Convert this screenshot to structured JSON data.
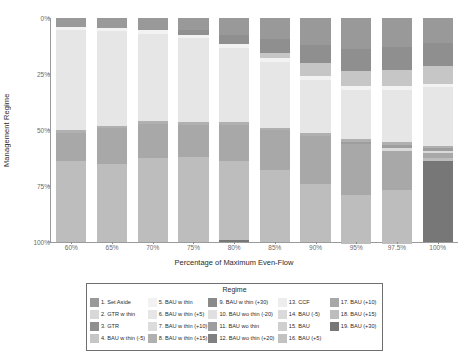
{
  "chart_data": {
    "type": "bar",
    "title": "",
    "xlabel": "Percentage of Maximum Even-Flow",
    "ylabel": "Management Regime",
    "stacked": true,
    "normalized_percent": true,
    "y_inverted": true,
    "ylim": [
      0,
      100
    ],
    "yticks": [
      "0%",
      "25%",
      "50%",
      "75%",
      "100%"
    ],
    "ytick_values": [
      0,
      25,
      50,
      75,
      100
    ],
    "grid": false,
    "legend_position": "bottom",
    "legend_title": "Regime",
    "categories": [
      "60%",
      "65%",
      "70%",
      "75%",
      "80%",
      "85%",
      "90%",
      "95%",
      "97.5%",
      "100%"
    ],
    "series": [
      {
        "name": "1. Set Aside",
        "color": "#999999",
        "values": [
          4.0,
          4.5,
          5.5,
          5.5,
          7.5,
          9.5,
          12.0,
          14.0,
          13.0,
          11.0
        ]
      },
      {
        "name": "2. GTR w thin",
        "color": "#d8d8d8",
        "values": [
          0.0,
          0.0,
          0.0,
          0.0,
          0.0,
          0.0,
          0.0,
          0.0,
          0.0,
          0.0
        ]
      },
      {
        "name": "3. GTR",
        "color": "#8f8f8f",
        "values": [
          0.0,
          0.0,
          0.0,
          2.0,
          4.0,
          6.0,
          8.0,
          9.5,
          10.0,
          10.5
        ]
      },
      {
        "name": "4. BAU w thin (-5)",
        "color": "#c6c6c6",
        "values": [
          0.0,
          0.0,
          0.0,
          0.0,
          0.0,
          2.5,
          6.0,
          7.0,
          7.5,
          8.0
        ]
      },
      {
        "name": "5. BAU w thin",
        "color": "#f2f2f2",
        "values": [
          1.5,
          1.5,
          1.5,
          1.5,
          2.0,
          1.5,
          1.5,
          1.5,
          1.5,
          1.5
        ]
      },
      {
        "name": "6. BAU w thin (+5)",
        "color": "#e6e6e6",
        "values": [
          44.5,
          42.0,
          39.0,
          37.5,
          33.0,
          29.5,
          24.0,
          22.0,
          23.5,
          26.0
        ]
      },
      {
        "name": "7. BAU w thin (+10)",
        "color": "#dcdcdc",
        "values": [
          0.0,
          0.0,
          0.0,
          0.0,
          0.0,
          0.0,
          0.0,
          0.0,
          0.0,
          0.0
        ]
      },
      {
        "name": "8. BAU w thin (+15)",
        "color": "#b0b0b0",
        "values": [
          1.2,
          1.2,
          1.2,
          1.2,
          1.2,
          1.2,
          1.2,
          1.2,
          1.2,
          1.2
        ]
      },
      {
        "name": "9. BAU w thin (+30)",
        "color": "#8a8a8a",
        "values": [
          0.0,
          0.0,
          0.0,
          0.0,
          0.0,
          0.0,
          0.0,
          0.0,
          0.0,
          0.0
        ]
      },
      {
        "name": "10. BAU wo thin (-20)",
        "color": "#e0e0e0",
        "values": [
          0.0,
          0.0,
          0.0,
          0.0,
          0.0,
          0.0,
          0.0,
          0.0,
          0.0,
          0.0
        ]
      },
      {
        "name": "11. BAU wo thin",
        "color": "#9e9e9e",
        "values": [
          0.0,
          0.0,
          0.0,
          0.0,
          0.0,
          0.0,
          0.0,
          1.2,
          1.2,
          1.0
        ]
      },
      {
        "name": "12. BAU wo thin (+20)",
        "color": "#808080",
        "values": [
          0.0,
          0.0,
          0.0,
          0.0,
          0.0,
          0.0,
          0.0,
          0.0,
          0.0,
          0.0
        ]
      },
      {
        "name": "13. CCF",
        "color": "#ededed",
        "values": [
          0.0,
          0.0,
          0.0,
          0.0,
          0.0,
          0.0,
          0.0,
          0.0,
          0.0,
          0.0
        ]
      },
      {
        "name": "14. BAU (-5)",
        "color": "#dadada",
        "values": [
          0.0,
          0.0,
          0.0,
          0.0,
          0.0,
          0.0,
          0.0,
          0.0,
          1.5,
          1.0
        ]
      },
      {
        "name": "15. BAU",
        "color": "#cfcfcf",
        "values": [
          0.0,
          0.0,
          0.0,
          0.0,
          0.0,
          0.0,
          0.0,
          0.0,
          0.0,
          0.0
        ]
      },
      {
        "name": "16. BAU (+5)",
        "color": "#c2c2c2",
        "values": [
          0.0,
          0.0,
          0.0,
          0.0,
          0.0,
          0.0,
          0.0,
          0.0,
          0.0,
          0.0
        ]
      },
      {
        "name": "17. BAU (+10)",
        "color": "#a8a8a8",
        "values": [
          12.8,
          15.8,
          15.3,
          14.3,
          16.3,
          17.8,
          21.3,
          22.6,
          17.6,
          2.3
        ]
      },
      {
        "name": "18. BAU (+15)",
        "color": "#bdbdbd",
        "values": [
          36.0,
          35.0,
          37.5,
          38.0,
          35.0,
          32.0,
          26.0,
          22.0,
          24.0,
          1.5
        ]
      },
      {
        "name": "19. BAU (+30)",
        "color": "#777777",
        "values": [
          0.0,
          0.0,
          0.0,
          0.0,
          1.0,
          0.0,
          0.0,
          0.0,
          0.0,
          36.0
        ]
      }
    ]
  },
  "axes": {
    "y_label": "Management Regime",
    "x_label": "Percentage of Maximum Even-Flow",
    "y_ticks": [
      "0%",
      "25%",
      "50%",
      "75%",
      "100%"
    ],
    "x_ticks": [
      "60%",
      "65%",
      "70%",
      "75%",
      "80%",
      "85%",
      "90%",
      "95%",
      "97.5%",
      "100%"
    ]
  },
  "legend": {
    "title": "Regime",
    "columns": [
      [
        {
          "label": "1. Set Aside",
          "color": "#999999"
        },
        {
          "label": "2. GTR w thin",
          "color": "#d8d8d8"
        },
        {
          "label": "3. GTR",
          "color": "#8f8f8f"
        },
        {
          "label": "4. BAU w thin (-5)",
          "color": "#c6c6c6"
        }
      ],
      [
        {
          "label": "5. BAU w thin",
          "color": "#f2f2f2"
        },
        {
          "label": "6. BAU w thin (+5)",
          "color": "#e6e6e6"
        },
        {
          "label": "7. BAU w thin (+10)",
          "color": "#dcdcdc"
        },
        {
          "label": "8. BAU w thin (+15)",
          "color": "#b0b0b0"
        }
      ],
      [
        {
          "label": "9. BAU w thin (+30)",
          "color": "#8a8a8a"
        },
        {
          "label": "10. BAU wo thin (-20)",
          "color": "#e0e0e0"
        },
        {
          "label": "11. BAU wo thin",
          "color": "#9e9e9e"
        },
        {
          "label": "12. BAU wo thin (+20)",
          "color": "#808080"
        }
      ],
      [
        {
          "label": "13. CCF",
          "color": "#ededed"
        },
        {
          "label": "14. BAU (-5)",
          "color": "#dadada"
        },
        {
          "label": "15. BAU",
          "color": "#cfcfcf"
        },
        {
          "label": "16. BAU (+5)",
          "color": "#c2c2c2"
        }
      ],
      [
        {
          "label": "17. BAU (+10)",
          "color": "#a8a8a8"
        },
        {
          "label": "18. BAU (+15)",
          "color": "#bdbdbd"
        },
        {
          "label": "19. BAU (+30)",
          "color": "#777777"
        }
      ]
    ]
  }
}
